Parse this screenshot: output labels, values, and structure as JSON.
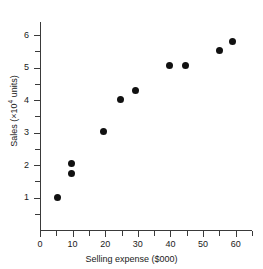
{
  "chart_data": {
    "type": "scatter",
    "title": "",
    "xlabel": "Selling expense ($000)",
    "ylabel_prefix": "Sales (×10",
    "ylabel_exponent": "4",
    "ylabel_suffix": " units)",
    "ylabel_full": "Sales (×10⁴ units)",
    "xlim": [
      0,
      65
    ],
    "ylim": [
      0,
      6.4
    ],
    "grid": false,
    "legend": null,
    "xticks": [
      0,
      10,
      20,
      30,
      40,
      50,
      60
    ],
    "xtick_labels": [
      "0",
      "10",
      "20",
      "30",
      "40",
      "50",
      "60"
    ],
    "xminor_ticks": [
      5,
      15,
      25,
      35,
      45,
      55,
      65
    ],
    "yticks": [
      1,
      2,
      3,
      4,
      5,
      6
    ],
    "ytick_labels": [
      "1",
      "2",
      "3",
      "4",
      "5",
      "6"
    ],
    "yminor_ticks": [
      0.5,
      1.5,
      2.5,
      3.5,
      4.5,
      5.5
    ],
    "marker": "filled-circle",
    "marker_color": "#111111",
    "axis_color": "#3a3a3a",
    "points": [
      {
        "x": 5.5,
        "y": 1.0
      },
      {
        "x": 9.8,
        "y": 1.73
      },
      {
        "x": 9.8,
        "y": 2.05
      },
      {
        "x": 19.6,
        "y": 3.03
      },
      {
        "x": 24.8,
        "y": 4.02
      },
      {
        "x": 29.2,
        "y": 4.3
      },
      {
        "x": 39.6,
        "y": 5.05
      },
      {
        "x": 44.5,
        "y": 5.07
      },
      {
        "x": 54.9,
        "y": 5.53
      },
      {
        "x": 59.0,
        "y": 5.8
      }
    ]
  }
}
